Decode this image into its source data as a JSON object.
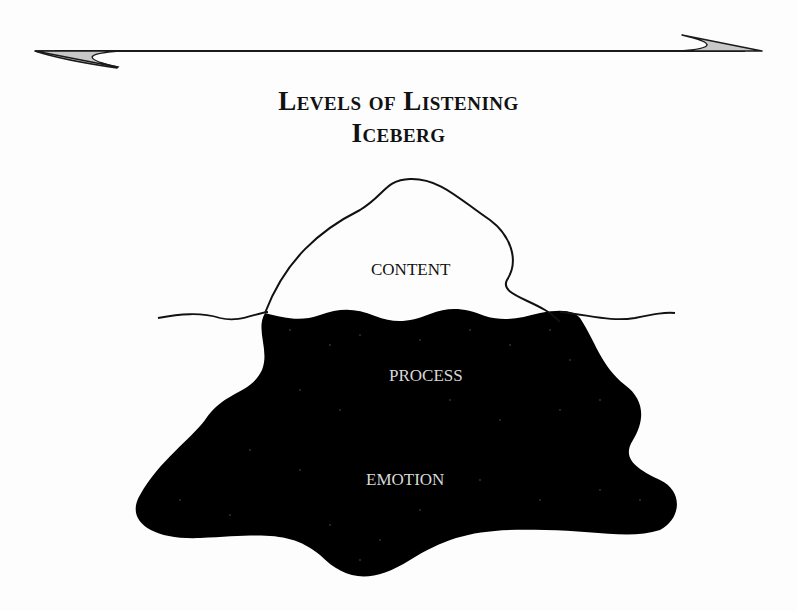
{
  "title": {
    "line1": "Levels of Listening",
    "line2": "Iceberg"
  },
  "levels": [
    {
      "label": "CONTENT",
      "position": "above waterline"
    },
    {
      "label": "PROCESS",
      "position": "below waterline"
    },
    {
      "label": "EMOTION",
      "position": "deep below waterline"
    }
  ],
  "graphics": {
    "double_arrow": "double-headed-arrow",
    "waterline": "wavy-waterline",
    "iceberg_tip_fill": "#ffffff",
    "iceberg_underwater_fill": "#000000",
    "arrowhead_fill": "#c8c8c8",
    "stroke_color": "#111111"
  }
}
